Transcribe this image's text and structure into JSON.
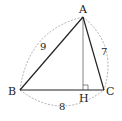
{
  "diagram": {
    "type": "triangle-with-altitude",
    "vertices": {
      "A": {
        "label": "A",
        "x": 83,
        "y": 17
      },
      "B": {
        "label": "B",
        "x": 20,
        "y": 90
      },
      "C": {
        "label": "C",
        "x": 104,
        "y": 90
      },
      "H": {
        "label": "H",
        "x": 83,
        "y": 90
      }
    },
    "side_lengths": {
      "AB": "9",
      "AC": "7",
      "BC": "8"
    },
    "colors": {
      "sides": "#222222",
      "altitude": "#777777",
      "dashed_arcs": "#999999",
      "text": "#222222"
    }
  }
}
